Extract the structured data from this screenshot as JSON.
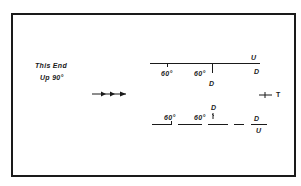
{
  "diagram": {
    "left_label": {
      "line1": "This End",
      "line2": "Up 90°"
    },
    "direction_arrow": "arrow-right-triple-icon",
    "upper_beam": {
      "labels": {
        "angle1": "60°",
        "angle2": "60°",
        "u": "U",
        "d_right": "D",
        "d_below": "D"
      }
    },
    "lower_beam": {
      "labels": {
        "angle1": "60°",
        "angle2": "60°",
        "d_above": "D",
        "d_frac_top": "D",
        "u_frac_bottom": "U"
      }
    },
    "tee_symbol": {
      "label": "T"
    },
    "colors": {
      "ink": "#1a1a1a",
      "background": "#ffffff"
    }
  }
}
